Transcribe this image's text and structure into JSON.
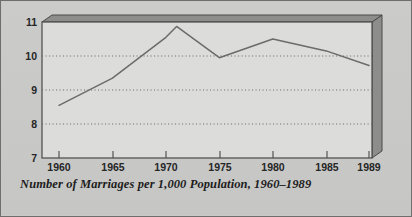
{
  "figure": {
    "caption": "Number of Marriages per 1,000 Population, 1960–1989",
    "background_color": "#c9c9c7",
    "border_color": "#6e6e6c",
    "plot_fill_color": "#dcdcda",
    "plot_frame_color": "#4a4a4a",
    "plot_shadow_color": "#8a8a88",
    "line_color": "#6b6b6b",
    "gridline_color": "#7d7d7b"
  },
  "chart_data": {
    "type": "line",
    "title": "Number of Marriages per 1,000 Population, 1960–1989",
    "xlabel": "",
    "ylabel": "",
    "xlim": [
      1960,
      1989
    ],
    "ylim": [
      7,
      11
    ],
    "yticks": [
      7,
      8,
      9,
      10,
      11
    ],
    "ytick_labels": [
      "7",
      "8",
      "9",
      "10",
      "11"
    ],
    "xticks": [
      1960,
      1965,
      1970,
      1975,
      1980,
      1985,
      1989
    ],
    "xtick_labels": [
      "1960",
      "1965",
      "1970",
      "1975",
      "1980",
      "1985",
      "1989"
    ],
    "grid": "horizontal-dotted",
    "legend": "none",
    "series": [
      {
        "name": "Marriages per 1,000 population",
        "x": [
          1960,
          1965,
          1970,
          1971,
          1975,
          1980,
          1985,
          1989
        ],
        "values": [
          8.55,
          9.35,
          10.55,
          10.87,
          9.95,
          10.5,
          10.15,
          9.72
        ]
      }
    ]
  }
}
